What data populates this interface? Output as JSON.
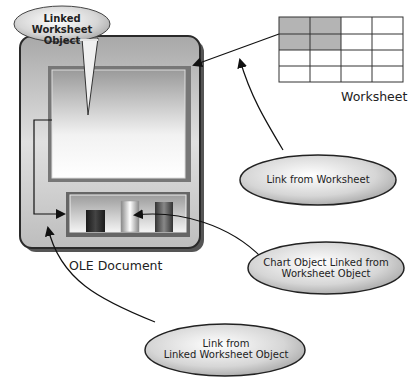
{
  "diagram": {
    "nodes": {
      "ole_document": {
        "label": "OLE Document"
      },
      "worksheet": {
        "label": "Worksheet",
        "grid": {
          "rows": 4,
          "cols": 4,
          "highlighted": [
            [
              0,
              0
            ],
            [
              0,
              1
            ],
            [
              1,
              0
            ],
            [
              1,
              1
            ]
          ]
        }
      },
      "linked_worksheet_object": {
        "label": "Linked Worksheet Object"
      },
      "chart_object": {
        "bars": 3
      }
    },
    "callouts": {
      "linked_worksheet_object": {
        "line1": "Linked Worksheet",
        "line2": "Object"
      },
      "link_from_worksheet": {
        "line1": "Link from Worksheet"
      },
      "chart_linked": {
        "line1": "Chart Object Linked from",
        "line2": "Worksheet Object"
      },
      "link_from_linked": {
        "line1": "Link from",
        "line2": "Linked Worksheet Object"
      }
    },
    "colors": {
      "document_fill": "#c8c8c8",
      "document_border": "#3a3a3a",
      "highlight_cell": "#b4b4b4",
      "line": "#222222"
    }
  }
}
